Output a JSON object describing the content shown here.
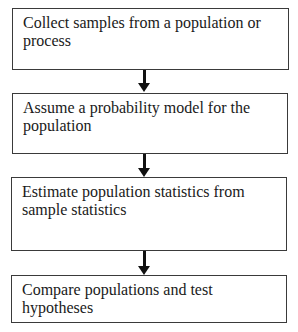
{
  "flowchart": {
    "steps": [
      {
        "label": "Collect samples from a population or process"
      },
      {
        "label": "Assume a probability model for the population"
      },
      {
        "label": "Estimate population statistics from sample statistics"
      },
      {
        "label": "Compare populations and test hypotheses"
      }
    ],
    "arrow_count": 3
  }
}
